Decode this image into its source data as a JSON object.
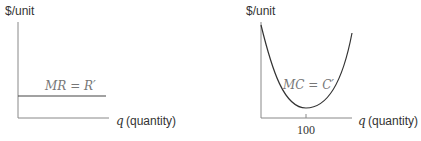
{
  "panels": [
    {
      "id": "marginal-revenue",
      "y_axis_label": "$/unit",
      "x_axis_var": "q",
      "x_axis_label": "(quantity)",
      "curve_label": "MR = R′",
      "curve_type": "horizontal line"
    },
    {
      "id": "marginal-cost",
      "y_axis_label": "$/unit",
      "x_axis_var": "q",
      "x_axis_label": "(quantity)",
      "curve_label": "MC = C′",
      "curve_type": "U-shaped curve",
      "x_tick_label": "100"
    }
  ],
  "colors": {
    "axis": "#888888",
    "curve": "#333333",
    "label": "#777777"
  }
}
